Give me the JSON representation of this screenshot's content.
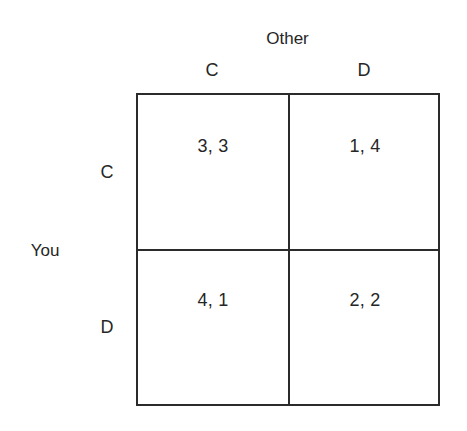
{
  "diagram": {
    "type": "payoff-matrix",
    "column_player_label": "Other",
    "row_player_label": "You",
    "column_headers": [
      "C",
      "D"
    ],
    "row_headers": [
      "C",
      "D"
    ],
    "cells": {
      "cc": "3, 3",
      "cd": "1, 4",
      "dc": "4, 1",
      "dd": "2, 2"
    },
    "colors": {
      "background": "#ffffff",
      "line": "#2b2b2b",
      "text": "#262626"
    }
  }
}
